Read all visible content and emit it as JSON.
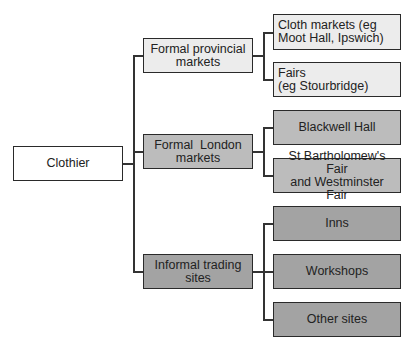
{
  "diagram": {
    "root": {
      "label": "Clothier"
    },
    "branches": [
      {
        "label": "Formal provincial markets",
        "label_lines": [
          "Formal provincial",
          "markets"
        ],
        "shade": "light",
        "children": [
          {
            "label": "Cloth markets (eg Moot Hall, Ipswich)",
            "label_lines": [
              "Cloth markets (eg",
              "Moot Hall, Ipswich)"
            ]
          },
          {
            "label": "Fairs (eg Stourbridge)",
            "label_lines": [
              "Fairs",
              "(eg Stourbridge)"
            ]
          }
        ]
      },
      {
        "label": "Formal London markets",
        "label_lines": [
          "Formal  London",
          "markets"
        ],
        "shade": "mid",
        "children": [
          {
            "label": "Blackwell Hall",
            "label_lines": [
              "Blackwell Hall"
            ]
          },
          {
            "label": "St Bartholomew's Fair and Westminster Fair",
            "label_lines": [
              "St Bartholomew's Fair",
              "and Westminster Fair"
            ]
          }
        ]
      },
      {
        "label": "Informal trading sites",
        "label_lines": [
          "Informal trading",
          "sites"
        ],
        "shade": "dark",
        "children": [
          {
            "label": "Inns",
            "label_lines": [
              "Inns"
            ]
          },
          {
            "label": "Workshops",
            "label_lines": [
              "Workshops"
            ]
          },
          {
            "label": "Other sites",
            "label_lines": [
              "Other sites"
            ]
          }
        ]
      }
    ],
    "colors": {
      "white": "#ffffff",
      "light": "#ececec",
      "mid": "#bcbcbc",
      "dark": "#a3a3a3",
      "border": "#2a2a2a"
    }
  }
}
